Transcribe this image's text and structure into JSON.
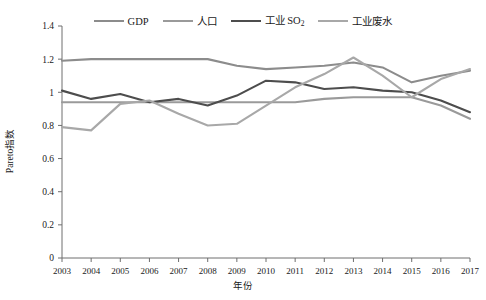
{
  "chart_data": {
    "type": "line",
    "title": "",
    "xlabel": "年份",
    "ylabel": "Pareto指数",
    "x": [
      2003,
      2004,
      2005,
      2006,
      2007,
      2008,
      2009,
      2010,
      2011,
      2012,
      2013,
      2014,
      2015,
      2016,
      2017
    ],
    "xlim": [
      2003,
      2017
    ],
    "ylim": [
      0,
      1.4
    ],
    "yticks": [
      "0",
      "0.2",
      "0.4",
      "0.6",
      "0.8",
      "1",
      "1.2",
      "1.4"
    ],
    "ytick_values": [
      0,
      0.2,
      0.4,
      0.6,
      0.8,
      1.0,
      1.2,
      1.4
    ],
    "grid": false,
    "legend_position": "top-center",
    "series": [
      {
        "name": "GDP",
        "color": "#8c8c8c",
        "values": [
          1.19,
          1.2,
          1.2,
          1.2,
          1.2,
          1.2,
          1.16,
          1.14,
          1.15,
          1.16,
          1.18,
          1.15,
          1.06,
          1.1,
          1.13
        ]
      },
      {
        "name": "人口",
        "color": "#9a9a9a",
        "values": [
          0.94,
          0.94,
          0.94,
          0.94,
          0.94,
          0.94,
          0.94,
          0.94,
          0.94,
          0.96,
          0.97,
          0.97,
          0.97,
          0.92,
          0.84
        ]
      },
      {
        "name": "工业 SO₂",
        "color": "#4d4d4d",
        "values": [
          1.01,
          0.96,
          0.99,
          0.94,
          0.96,
          0.92,
          0.98,
          1.07,
          1.06,
          1.02,
          1.03,
          1.01,
          1.0,
          0.95,
          0.88
        ]
      },
      {
        "name": "工业废水",
        "color": "#a8a8a8",
        "values": [
          0.79,
          0.77,
          0.93,
          0.95,
          0.87,
          0.8,
          0.81,
          0.92,
          1.03,
          1.11,
          1.21,
          1.1,
          0.97,
          1.08,
          1.14
        ]
      }
    ],
    "legend": [
      {
        "label_html": "GDP",
        "color": "#8c8c8c"
      },
      {
        "label_html": "人口",
        "color": "#9a9a9a"
      },
      {
        "label_html": "工业 SO<sub>2</sub>",
        "color": "#4d4d4d"
      },
      {
        "label_html": "工业废水",
        "color": "#a8a8a8"
      }
    ],
    "axis_color": "#6e6e6e"
  }
}
